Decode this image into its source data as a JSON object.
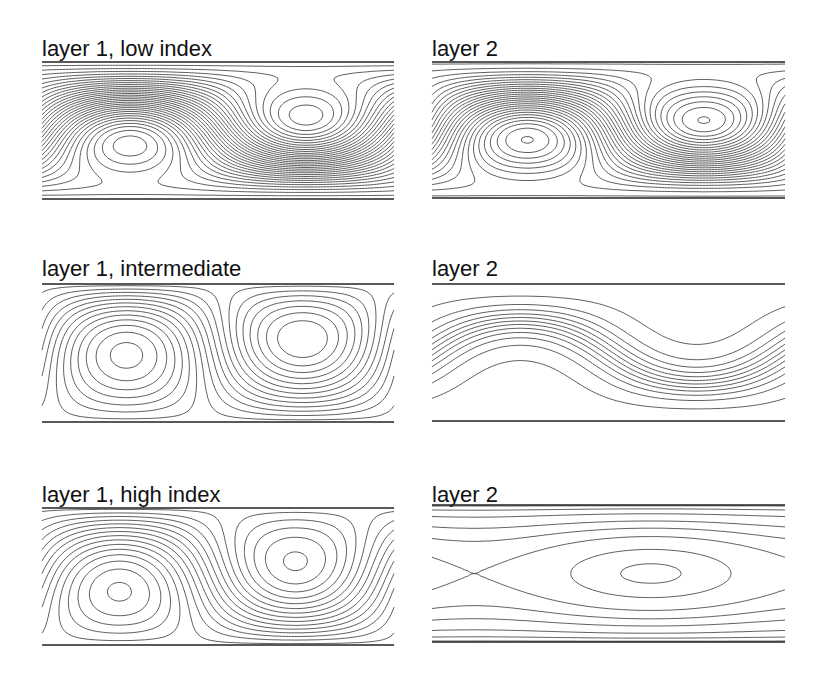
{
  "figure": {
    "panels": [
      {
        "id": "p1",
        "title": "layer 1, low index",
        "row": 1,
        "col": 1
      },
      {
        "id": "p2",
        "title": "layer 2",
        "row": 1,
        "col": 2
      },
      {
        "id": "p3",
        "title": "layer 1, intermediate",
        "row": 2,
        "col": 1
      },
      {
        "id": "p4",
        "title": "layer 2",
        "row": 2,
        "col": 2
      },
      {
        "id": "p5",
        "title": "layer 1, high index",
        "row": 3,
        "col": 1
      },
      {
        "id": "p6",
        "title": "layer 2",
        "row": 3,
        "col": 2
      }
    ]
  }
}
